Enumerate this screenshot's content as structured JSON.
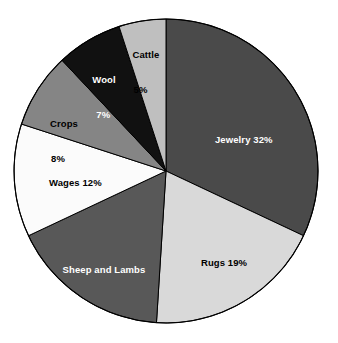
{
  "chart_data": {
    "type": "pie",
    "title": "",
    "subtitle": "",
    "xlabel": "",
    "ylabel": "",
    "legend_position": "none",
    "grid": false,
    "units": "percent",
    "total": 100,
    "categories": [
      "Jewelry",
      "Rugs",
      "Sheep and Lambs",
      "Wages",
      "Crops",
      "Wool",
      "Cattle"
    ],
    "values": [
      32,
      19,
      17,
      12,
      8,
      7,
      5
    ],
    "slices": [
      {
        "name": "Jewelry",
        "value": 32,
        "value_text": "32%",
        "label_text": "Jewelry 32%",
        "label_line1": "Jewelry 32%",
        "label_line2": "",
        "color": "#4a4a4a",
        "text_color": "#ffffff",
        "start_angle": 0,
        "end_angle": 115.2,
        "label_x": 204,
        "label_y": 122,
        "label_align": "left"
      },
      {
        "name": "Rugs",
        "value": 19,
        "value_text": "19%",
        "label_text": "Rugs 19%",
        "label_line1": "Rugs 19%",
        "label_line2": "",
        "color": "#d9d9d9",
        "text_color": "#000000",
        "start_angle": 115.2,
        "end_angle": 183.6,
        "label_x": 190,
        "label_y": 245,
        "label_align": "left"
      },
      {
        "name": "Sheep and Lambs",
        "value": 17,
        "value_text": "17%",
        "label_text": "Sheep and Lambs 17%",
        "label_line1": "Sheep and Lambs",
        "label_line2": "17%",
        "color": "#585858",
        "text_color": "#ffffff",
        "start_angle": 183.6,
        "end_angle": 244.8,
        "label_x": 104,
        "label_y": 241,
        "label_align": "center"
      },
      {
        "name": "Wages",
        "value": 12,
        "value_text": "12%",
        "label_text": "Wages 12%",
        "label_line1": "Wages 12%",
        "label_line2": "",
        "color": "#fbfbfb",
        "text_color": "#000000",
        "start_angle": 244.8,
        "end_angle": 288.0,
        "label_x": 38,
        "label_y": 165,
        "label_align": "left"
      },
      {
        "name": "Crops",
        "value": 8,
        "value_text": "8%",
        "label_text": "Crops 8%",
        "label_line1": "Crops",
        "label_line2": "8%",
        "color": "#858585",
        "text_color": "#000000",
        "start_angle": 288.0,
        "end_angle": 316.8,
        "label_x": 64,
        "label_y": 95,
        "label_align": "center"
      },
      {
        "name": "Wool",
        "value": 7,
        "value_text": "7%",
        "label_text": "Wool 7%",
        "label_line1": "Wool",
        "label_line2": "7%",
        "color": "#111111",
        "text_color": "#ffffff",
        "start_angle": 316.8,
        "end_angle": 342.0,
        "label_x": 104,
        "label_y": 51,
        "label_align": "center"
      },
      {
        "name": "Cattle",
        "value": 5,
        "value_text": "5%",
        "label_text": "Cattle 5%",
        "label_line1": "Cattle",
        "label_line2": "5%",
        "color": "#bfbfbf",
        "text_color": "#000000",
        "start_angle": 342.0,
        "end_angle": 360.0,
        "label_x": 146,
        "label_y": 26,
        "label_align": "center"
      }
    ],
    "geometry": {
      "center_x": 166,
      "center_y": 171,
      "radius": 152,
      "outline_color": "#000000"
    },
    "background_color": "#ffffff"
  }
}
